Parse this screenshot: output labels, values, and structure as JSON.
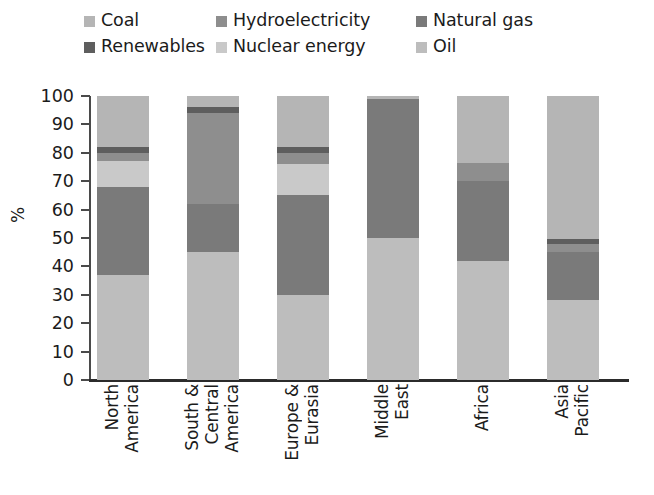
{
  "legend": {
    "rows": [
      [
        {
          "label": "Coal",
          "key": "coal",
          "swatch": "legend-swatch-coal"
        },
        {
          "label": "Hydroelectricity",
          "key": "hydroelectricity",
          "swatch": "legend-swatch-hydroelectricity"
        },
        {
          "label": "Natural gas",
          "key": "natural_gas",
          "swatch": "legend-swatch-natural-gas"
        }
      ],
      [
        {
          "label": "Renewables",
          "key": "renewables",
          "swatch": "legend-swatch-renewables"
        },
        {
          "label": "Nuclear energy",
          "key": "nuclear_energy",
          "swatch": "legend-swatch-nuclear-energy"
        },
        {
          "label": "Oil",
          "key": "oil",
          "swatch": "legend-swatch-oil"
        }
      ]
    ]
  },
  "colors": {
    "coal": "#b5b5b5",
    "hydroelectricity": "#8e8e8e",
    "natural_gas": "#7a7a7a",
    "renewables": "#5e5e5e",
    "nuclear_energy": "#c9c9c9",
    "oil": "#bdbdbd",
    "axis": "#2b2b2b",
    "text": "#1b1b1b"
  },
  "chart_data": {
    "type": "bar",
    "stacked": true,
    "title": "",
    "xlabel": "",
    "ylabel": "%",
    "ylim": [
      0,
      100
    ],
    "yticks": [
      0,
      10,
      20,
      30,
      40,
      50,
      60,
      70,
      80,
      90,
      100
    ],
    "grid": false,
    "legend_position": "top",
    "categories": [
      "North America",
      "South & Central America",
      "Europe & Eurasia",
      "Middle East",
      "Africa",
      "Asia Pacific"
    ],
    "category_lines": [
      [
        "North",
        "America"
      ],
      [
        "South &",
        "Central",
        "America"
      ],
      [
        "Europe &",
        "Eurasia"
      ],
      [
        "Middle",
        "East"
      ],
      [
        "Africa"
      ],
      [
        "Asia",
        "Pacific"
      ]
    ],
    "series": [
      {
        "name": "Oil",
        "key": "oil",
        "values": [
          37,
          45,
          30,
          50,
          42,
          28
        ]
      },
      {
        "name": "Natural gas",
        "key": "natural_gas",
        "values": [
          31,
          17,
          35,
          49,
          28,
          17
        ]
      },
      {
        "name": "Nuclear energy",
        "key": "nuclear_energy",
        "values": [
          9,
          0,
          11,
          0,
          0,
          0
        ]
      },
      {
        "name": "Hydroelectricity",
        "key": "hydroelectricity",
        "values": [
          3,
          32,
          4,
          0,
          6.5,
          3
        ]
      },
      {
        "name": "Renewables",
        "key": "renewables",
        "values": [
          2,
          2,
          2,
          0,
          0,
          1.5
        ]
      },
      {
        "name": "Coal",
        "key": "coal",
        "values": [
          18,
          4,
          18,
          1,
          23.5,
          50.5
        ]
      }
    ]
  }
}
